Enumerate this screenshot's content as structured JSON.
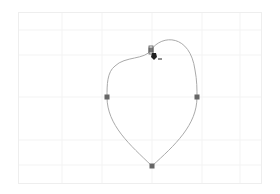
{
  "canvas": {
    "x": 18,
    "y": 12,
    "width": 244,
    "height": 172,
    "background": "#ffffff",
    "border_color": "#eeeeee",
    "grid": {
      "visible": true,
      "color": "#f3f3f3",
      "vertical_lines": [
        62,
        102,
        152,
        202,
        240
      ],
      "horizontal_lines": [
        30,
        55,
        97,
        140,
        165
      ]
    }
  },
  "path": {
    "stroke_color": "#aaaaaa",
    "stroke_width": 1,
    "closed": true,
    "d": "M151,50 C162,34 190,34 195,70 C197,80 197,90 197,97 C197,125 175,145 152,166 C130,145 107,125 107,97 C107,85 107,72 115,66 C125,56 145,60 151,50 Z"
  },
  "anchors": [
    {
      "id": "top",
      "x": 151,
      "y": 50,
      "selected": true
    },
    {
      "id": "left",
      "x": 107,
      "y": 97,
      "selected": false
    },
    {
      "id": "right",
      "x": 197,
      "y": 97,
      "selected": false
    },
    {
      "id": "bottom",
      "x": 152,
      "y": 166,
      "selected": false
    }
  ],
  "anchor_style": {
    "size": 5,
    "fill": "#666666",
    "selected_fill": "#777777"
  },
  "cursor": {
    "type": "pen-tool-cursor",
    "x": 153,
    "y": 55,
    "color": "#222222"
  }
}
